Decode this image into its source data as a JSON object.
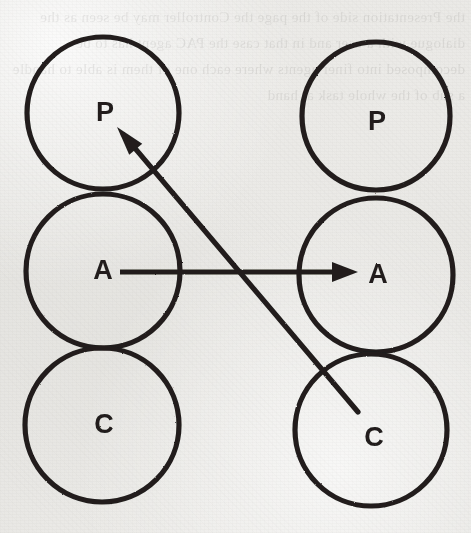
{
  "figure": {
    "width": 471,
    "height": 533,
    "background_color": "#e9e8e5",
    "ink_color": "#201e1c",
    "stroke_width": 5
  },
  "bleed_through_text": "the Presentation side of the page the Controller may be seen as the dialogue with a user and in that case the PAC agent has to be decomposed into finer agents where each one of them is able to handle a sub of the whole task at hand",
  "chart_data": {
    "type": "diagram",
    "node_radius": 76,
    "columns": [
      {
        "name": "left-column",
        "cx": 103,
        "nodes": [
          {
            "id": "left-p",
            "label": "P",
            "cx": 103,
            "cy": 113,
            "r": 76,
            "label_x": 105,
            "label_y": 121
          },
          {
            "id": "left-a",
            "label": "A",
            "cx": 103,
            "cy": 271,
            "r": 77,
            "label_x": 103,
            "label_y": 279
          },
          {
            "id": "left-c",
            "label": "C",
            "cx": 102,
            "cy": 425,
            "r": 77,
            "label_x": 104,
            "label_y": 433
          }
        ]
      },
      {
        "name": "right-column",
        "cx": 376,
        "nodes": [
          {
            "id": "right-p",
            "label": "P",
            "cx": 376,
            "cy": 116,
            "r": 74,
            "label_x": 377,
            "label_y": 130
          },
          {
            "id": "right-a",
            "label": "A",
            "cx": 376,
            "cy": 275,
            "r": 77,
            "label_x": 378,
            "label_y": 283
          },
          {
            "id": "right-c",
            "label": "C",
            "cx": 371,
            "cy": 430,
            "r": 76,
            "label_x": 374,
            "label_y": 446
          }
        ]
      }
    ],
    "arrows": [
      {
        "id": "arrow-a-to-a",
        "name": "horizontal-arrow-left-a-to-right-a",
        "from": "left-a",
        "to": "right-a",
        "x1": 120,
        "y1": 272,
        "x2": 358,
        "y2": 272,
        "head": "end"
      },
      {
        "id": "arrow-c-to-p",
        "name": "diagonal-arrow-right-c-to-left-p",
        "from": "right-c",
        "to": "left-p",
        "x1": 358,
        "y1": 412,
        "x2": 117,
        "y2": 127,
        "head": "end"
      }
    ],
    "legend": [],
    "xlabel": "",
    "ylabel": ""
  }
}
